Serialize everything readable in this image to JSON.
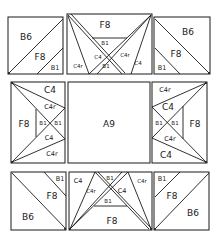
{
  "diagram": {
    "type": "quilt-block-layout",
    "blocks": {
      "top_left": {
        "labels": [
          "B6",
          "F8",
          "B1"
        ]
      },
      "top_center": {
        "labels": [
          "F8",
          "B1",
          "C4r",
          "C4",
          "B1",
          "C4r",
          "C4"
        ]
      },
      "top_right": {
        "labels": [
          "B6",
          "F8",
          "B1"
        ]
      },
      "middle_left": {
        "labels": [
          "C4",
          "C4r",
          "F8",
          "B1",
          "B1",
          "C4",
          "C4r"
        ]
      },
      "center": {
        "labels": [
          "A9"
        ]
      },
      "middle_right": {
        "labels": [
          "C4r",
          "C4",
          "B1",
          "B1",
          "F8",
          "C4r",
          "C4"
        ]
      },
      "bottom_left": {
        "labels": [
          "B1",
          "F8",
          "B6"
        ]
      },
      "bottom_center": {
        "labels": [
          "C4",
          "C4r",
          "B1",
          "C4",
          "B1",
          "C4r",
          "F8"
        ]
      },
      "bottom_right": {
        "labels": [
          "B1",
          "F8",
          "B6"
        ]
      }
    }
  }
}
